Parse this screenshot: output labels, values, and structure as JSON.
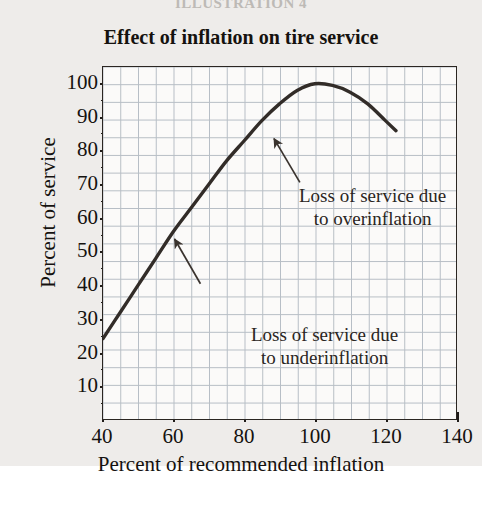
{
  "page": {
    "illustration_caption": "ILLUSTRATION 4",
    "background_color": "#eeecea",
    "ink_color": "#15120f",
    "grid_color": "#8e9aa6",
    "curve_color": "#322c28"
  },
  "chart_data": {
    "type": "line",
    "title": "Effect of inflation on tire service",
    "xlabel": "Percent of recommended inflation",
    "ylabel": "Percent of service",
    "xlim": [
      40,
      140
    ],
    "ylim": [
      0,
      105
    ],
    "xticks": [
      40,
      60,
      80,
      100,
      120,
      140
    ],
    "xtick_labels": [
      "40",
      "60",
      "80",
      "100",
      "120",
      "140"
    ],
    "yticks": [
      10,
      20,
      30,
      40,
      50,
      60,
      70,
      80,
      90,
      100
    ],
    "ytick_labels": [
      "10",
      "20",
      "30",
      "40",
      "50",
      "60",
      "70",
      "80",
      "90",
      "100"
    ],
    "minor_tick_step_x": 5,
    "minor_tick_step_y": 5,
    "grid": true,
    "grid_step_x": 5,
    "grid_step_y": 5,
    "legend": "none",
    "series": [
      {
        "name": "Percent of service",
        "x": [
          40,
          45,
          50,
          55,
          60,
          65,
          70,
          75,
          80,
          85,
          90,
          95,
          100,
          105,
          110,
          115,
          120,
          123
        ],
        "values": [
          24,
          32,
          40,
          48,
          56,
          63,
          70,
          77,
          83,
          89,
          94,
          98,
          100,
          99.5,
          97.5,
          94,
          89,
          86
        ]
      }
    ],
    "annotations": [
      {
        "id": "overinflation",
        "line1": "Loss of service due",
        "line2": "to overinflation",
        "points_to": [
          119,
          90
        ]
      },
      {
        "id": "underinflation",
        "line1": "Loss of service due",
        "line2": "to underinflation",
        "points_to": [
          60,
          56
        ]
      }
    ]
  }
}
